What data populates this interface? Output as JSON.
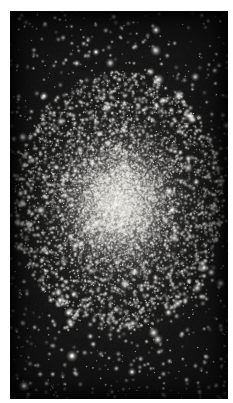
{
  "image": {
    "subject": "globular-star-cluster",
    "alt_text": "Dense spherical swarm of stars concentrated toward a bright unresolved core, set against a black night sky",
    "medium": "photographic-plate",
    "orientation": "portrait"
  },
  "canvas": {
    "width": 233,
    "height": 403,
    "background_color": "#ffffff"
  },
  "plate": {
    "left": 10,
    "top": 11,
    "width": 218,
    "height": 388,
    "sky_color": "#050505",
    "fog_color": "#1a1a1a"
  },
  "cluster": {
    "center_x": 119,
    "center_y": 201,
    "core_radius": 34,
    "halo_radius_x": 105,
    "halo_radius_y": 130,
    "core_color": "#cdcbc6",
    "star_color": "#f2f0ea",
    "glow_opacity": 0.8
  },
  "starfield": {
    "seed": 20240517,
    "core_star_count": 5200,
    "halo_star_count": 3400,
    "field_star_count": 1100,
    "bright_star_count": 70,
    "min_radius": 0.35,
    "max_radius": 1.5,
    "bright_star_radius": 2.0
  },
  "bright_stars": [
    {
      "x": 72,
      "y": 356,
      "r": 2.6
    },
    {
      "x": 24,
      "y": 386,
      "r": 2.4
    },
    {
      "x": 156,
      "y": 30,
      "r": 2.1
    },
    {
      "x": 190,
      "y": 116,
      "r": 2.0
    },
    {
      "x": 44,
      "y": 96,
      "r": 1.9
    },
    {
      "x": 204,
      "y": 268,
      "r": 2.0
    },
    {
      "x": 132,
      "y": 372,
      "r": 1.9
    },
    {
      "x": 60,
      "y": 300,
      "r": 1.8
    },
    {
      "x": 172,
      "y": 210,
      "r": 1.8
    },
    {
      "x": 96,
      "y": 52,
      "r": 1.7
    }
  ],
  "grain": {
    "opacity": 0.3,
    "intensity": 34
  }
}
